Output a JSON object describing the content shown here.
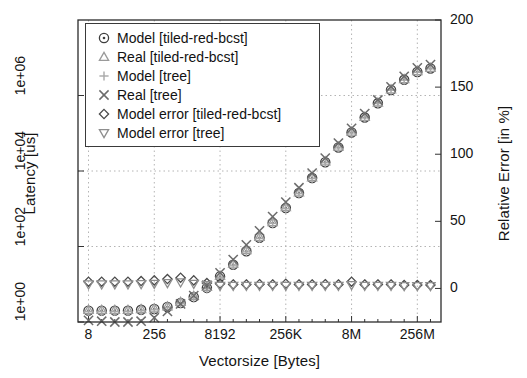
{
  "chart_data": {
    "type": "scatter",
    "title": "",
    "xlabel": "Vectorsize [Bytes]",
    "ylabel": "Latency [us]",
    "y2label": "Relative Error [in %]",
    "grid": true,
    "legend_position": "upper-left",
    "xscale": "log2",
    "yscale": "log10",
    "xtick_labels": [
      "8",
      "256",
      "8192",
      "256K",
      "8M",
      "256M"
    ],
    "xtick_values": [
      8,
      256,
      8192,
      262144,
      8388608,
      268435456
    ],
    "ytick_labels": [
      "1e+00",
      "1e+02",
      "1e+04",
      "1e+06"
    ],
    "ytick_values": [
      1,
      100,
      10000,
      1000000
    ],
    "ylim": [
      1,
      100000000
    ],
    "y2tick_labels": [
      "0",
      "50",
      "100",
      "150",
      "200"
    ],
    "y2tick_values": [
      0,
      50,
      100,
      150,
      200
    ],
    "y2lim": [
      -25,
      200
    ],
    "x": [
      8,
      16,
      32,
      64,
      128,
      256,
      512,
      1024,
      2048,
      4096,
      8192,
      16384,
      32768,
      65536,
      131072,
      262144,
      524288,
      1048576,
      2097152,
      4194304,
      8388608,
      16777216,
      33554432,
      67108864,
      134217728,
      268435456,
      536870912
    ],
    "series": [
      {
        "name": "Model [tiled-red-bcst]",
        "marker": "circle-dot",
        "axis": "left",
        "color": "#3d3d3d",
        "values": [
          2.0,
          2.0,
          2.0,
          2.0,
          2.1,
          2.2,
          2.5,
          3.2,
          4.6,
          8.0,
          16.0,
          33.0,
          75.0,
          170.0,
          420.0,
          1050.0,
          2600.0,
          6500.0,
          17000.0,
          42000.0,
          105000.0,
          260000.0,
          620000.0,
          1400000.0,
          2600000.0,
          4200000.0,
          5200000.0
        ]
      },
      {
        "name": "Real [tiled-red-bcst]",
        "marker": "triangle-up",
        "axis": "left",
        "color": "#9a9a9a",
        "values": [
          2.1,
          2.1,
          2.1,
          2.1,
          2.2,
          2.3,
          2.6,
          3.4,
          4.9,
          8.5,
          17.0,
          35.0,
          80.0,
          180.0,
          440.0,
          1100.0,
          2700.0,
          6800.0,
          18000.0,
          44000.0,
          110000.0,
          270000.0,
          650000.0,
          1450000.0,
          2700000.0,
          4400000.0,
          5400000.0
        ]
      },
      {
        "name": "Model [tree]",
        "marker": "plus",
        "axis": "left",
        "color": "#a8a8a8",
        "values": [
          1.9,
          1.9,
          1.9,
          1.9,
          2.0,
          2.1,
          2.4,
          3.1,
          4.4,
          7.6,
          15.0,
          32.0,
          72.0,
          165.0,
          410.0,
          1000.0,
          2500.0,
          6300.0,
          16500.0,
          41000.0,
          102000.0,
          255000.0,
          610000.0,
          1380000.0,
          2550000.0,
          4100000.0,
          5100000.0
        ]
      },
      {
        "name": "Real [tree]",
        "marker": "cross",
        "axis": "left",
        "color": "#6b6b6b",
        "values": [
          1.1,
          1.05,
          1.0,
          1.0,
          1.05,
          1.3,
          1.9,
          3.0,
          5.0,
          9.5,
          20.0,
          45.0,
          110.0,
          260.0,
          620.0,
          1500.0,
          3600.0,
          8800.0,
          22000.0,
          55000.0,
          135000.0,
          330000.0,
          760000.0,
          1700000.0,
          3200000.0,
          5400000.0,
          6600000.0
        ]
      },
      {
        "name": "Model error [tiled-red-bcst]",
        "marker": "diamond",
        "axis": "right",
        "color": "#4a4a4a",
        "values": [
          5.0,
          5.0,
          5.0,
          5.0,
          5.5,
          6.0,
          7.0,
          8.0,
          6.0,
          4.0,
          3.5,
          3.0,
          3.0,
          3.2,
          3.0,
          3.5,
          3.0,
          3.0,
          3.2,
          3.0,
          5.0,
          3.0,
          3.0,
          3.0,
          2.5,
          2.5,
          2.5
        ]
      },
      {
        "name": "Model error [tree]",
        "marker": "triangle-down",
        "axis": "right",
        "color": "#8e8e8e",
        "values": [
          3.0,
          3.0,
          3.0,
          3.0,
          3.2,
          3.5,
          4.0,
          4.5,
          3.5,
          2.5,
          2.0,
          2.0,
          2.0,
          2.0,
          2.0,
          2.0,
          2.0,
          2.0,
          2.0,
          2.0,
          2.5,
          2.0,
          2.0,
          2.0,
          1.8,
          1.8,
          1.8
        ]
      }
    ]
  },
  "legend": {
    "entries": [
      {
        "label": "Model [tiled-red-bcst]",
        "marker": "circle-dot"
      },
      {
        "label": "Real [tiled-red-bcst]",
        "marker": "triangle-up"
      },
      {
        "label": "Model [tree]",
        "marker": "plus"
      },
      {
        "label": "Real [tree]",
        "marker": "cross"
      },
      {
        "label": "Model error [tiled-red-bcst]",
        "marker": "diamond"
      },
      {
        "label": "Model error [tree]",
        "marker": "triangle-down"
      }
    ]
  }
}
